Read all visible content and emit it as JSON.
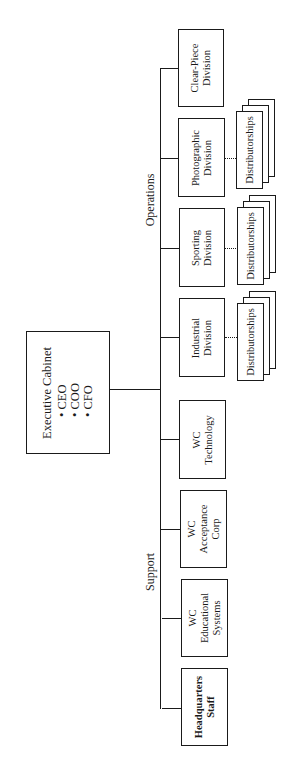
{
  "diagram": {
    "type": "org-chart",
    "orientation": "rotated-90-ccw",
    "root": {
      "title": "Executive Cabinet",
      "members": [
        "CEO",
        "COO",
        "CFO"
      ]
    },
    "groups": [
      {
        "label": "Operations",
        "units": [
          {
            "name_line1": "Clear-Piece",
            "name_line2": "Division",
            "name_line3": "",
            "has_distributorships": false
          },
          {
            "name_line1": "Photographic",
            "name_line2": "Division",
            "name_line3": "",
            "has_distributorships": true
          },
          {
            "name_line1": "Sporting",
            "name_line2": "Division",
            "name_line3": "",
            "has_distributorships": true
          },
          {
            "name_line1": "Industrial",
            "name_line2": "Division",
            "name_line3": "",
            "has_distributorships": true
          }
        ]
      },
      {
        "label": "Support",
        "units": [
          {
            "name_line1": "WC",
            "name_line2": "Technology",
            "name_line3": "",
            "has_distributorships": false
          },
          {
            "name_line1": "WC",
            "name_line2": "Acceptance",
            "name_line3": "Corp",
            "has_distributorships": false
          },
          {
            "name_line1": "WC",
            "name_line2": "Educational",
            "name_line3": "Systems",
            "has_distributorships": false
          },
          {
            "name_line1": "Headquarters",
            "name_line2": "Staff",
            "name_line3": "",
            "has_distributorships": false
          }
        ]
      }
    ],
    "distributorships_label": "Distributorships",
    "colors": {
      "line": "#1a1a1a",
      "background": "#ffffff"
    }
  }
}
